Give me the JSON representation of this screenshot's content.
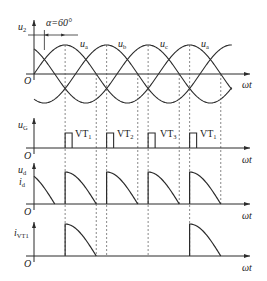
{
  "figure": {
    "alpha_label": "α=60°",
    "origin_label": "O",
    "x_axis_label": "ωt",
    "panels": [
      {
        "id": "u2",
        "y_label": "u",
        "y_sub": "2",
        "curves": [
          "u",
          "u",
          "u",
          "u"
        ],
        "curve_subs": [
          "a",
          "b",
          "c",
          "a"
        ]
      },
      {
        "id": "uG",
        "y_label": "u",
        "y_sub": "G",
        "pulses": [
          "VT",
          "VT",
          "VT",
          "VT"
        ],
        "pulse_subs": [
          "1",
          "2",
          "3",
          "1"
        ]
      },
      {
        "id": "ud",
        "y_label_1": "u",
        "y_sub_1": "d",
        "y_label_2": "i",
        "y_sub_2": "d"
      },
      {
        "id": "iVT1",
        "y_label": "i",
        "y_sub": "VT1"
      }
    ],
    "colors": {
      "line": "#2b2b2b",
      "dashed": "#555555",
      "background": "#ffffff"
    }
  }
}
